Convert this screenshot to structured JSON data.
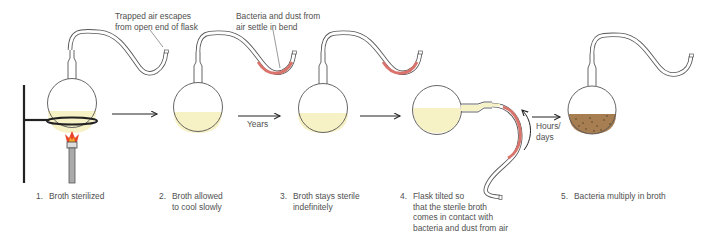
{
  "callouts": {
    "trapped_air": "Trapped air escapes\nfrom open end of flask",
    "bacteria_settle": "Bacteria and dust from\nair settle in bend"
  },
  "arrow_labels": {
    "years": "Years",
    "hours_days": "Hours/\ndays"
  },
  "steps": [
    {
      "num": "1.",
      "text": "Broth sterilized"
    },
    {
      "num": "2.",
      "text": "Broth allowed\nto cool slowly"
    },
    {
      "num": "3.",
      "text": "Broth stays sterile\nindefinitely"
    },
    {
      "num": "4.",
      "text": "Flask tilted so\nthat the sterile broth\ncomes in contact with\nbacteria and dust from air"
    },
    {
      "num": "5.",
      "text": "Bacteria multiply in broth"
    }
  ],
  "colors": {
    "sterile_broth": "#f7f1c6",
    "contaminated_broth": "#a77e52",
    "contamination": "#d9736b",
    "flame": "#e8452a",
    "stand": "#222222",
    "glass": "#555555"
  }
}
